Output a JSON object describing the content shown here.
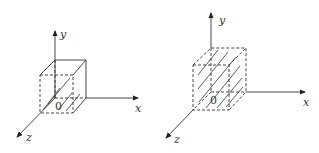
{
  "figures": [
    {
      "id": "left",
      "description": "Cube at origin with solid back edges and hatched front faces",
      "labels": {
        "y": "y",
        "x": "x",
        "z": "z",
        "origin": "0"
      }
    },
    {
      "id": "right",
      "description": "Cube at origin drawn entirely dashed with hatched interior",
      "labels": {
        "y": "y",
        "x": "x",
        "z": "z",
        "origin": "0"
      }
    }
  ],
  "colors": {
    "stroke": "#333333",
    "background": "#ffffff"
  }
}
